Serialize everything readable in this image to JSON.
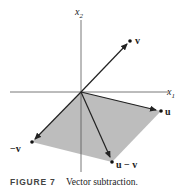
{
  "figure": {
    "axes": {
      "x1_label": "x",
      "x1_sub": "1",
      "x2_label": "x",
      "x2_sub": "2"
    },
    "origin": [
      81,
      92
    ],
    "points": {
      "v": {
        "label": "v",
        "pos": [
          130,
          41
        ]
      },
      "u": {
        "label": "u",
        "pos": [
          161,
          111
        ]
      },
      "neg_v": {
        "label": "−v",
        "pos": [
          32,
          142
        ]
      },
      "u_minus_v": {
        "label": "u − v",
        "pos": [
          112,
          162
        ]
      }
    },
    "parallelogram_fill": "#bdbdbd",
    "caption": {
      "number": "FIGURE 7",
      "text": "Vector subtraction."
    }
  }
}
